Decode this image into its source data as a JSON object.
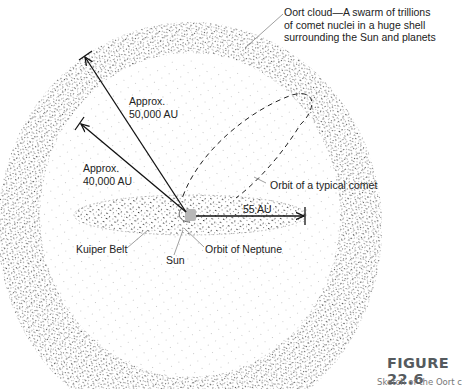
{
  "diagram": {
    "labels": {
      "oort_cloud": [
        "Oort cloud—A swarm of trillions",
        "of comet nuclei in a huge shell",
        "surrounding the Sun and planets"
      ],
      "approx_50000": [
        "Approx.",
        "50,000 AU"
      ],
      "approx_40000": [
        "Approx.",
        "40,000 AU"
      ],
      "orbit_comet": "Orbit of a typical comet",
      "au_55": "55 AU",
      "kuiper_belt": "Kuiper Belt",
      "orbit_neptune": "Orbit of Neptune",
      "sun": "Sun"
    },
    "colors": {
      "dots_dark": "#3a3a3a",
      "dots_light": "#9a9a9a",
      "sun": "#b8b8b8",
      "lines": "#111111"
    }
  },
  "figure": {
    "number": "FIGURE 22.6",
    "caption": "Sketch of the Oort c"
  }
}
